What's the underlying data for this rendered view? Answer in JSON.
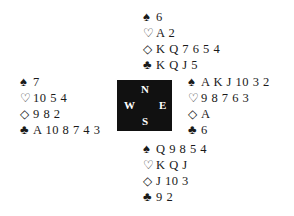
{
  "compass": {
    "north": "N",
    "south": "S",
    "east": "E",
    "west": "W"
  },
  "suit_symbols": {
    "spades": "♠",
    "hearts": "♡",
    "diamonds": "◇",
    "clubs": "♣"
  },
  "hands": {
    "north": {
      "spades": "6",
      "hearts": "A 2",
      "diamonds": "K Q 7 6 5 4",
      "clubs": "K Q J 5"
    },
    "west": {
      "spades": "7",
      "hearts": "10 5 4",
      "diamonds": "9 8 2",
      "clubs": "A 10 8 7 4 3"
    },
    "east": {
      "spades": "A K J 10 3 2",
      "hearts": "9 8 7 6 3",
      "diamonds": "A",
      "clubs": "6"
    },
    "south": {
      "spades": "Q 9 8 5 4",
      "hearts": "K Q J",
      "diamonds": "J 10 3",
      "clubs": "9 2"
    }
  }
}
